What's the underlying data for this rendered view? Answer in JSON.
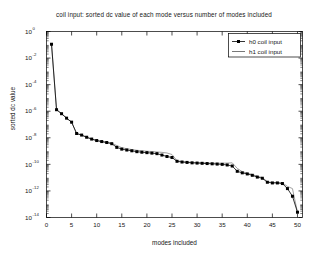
{
  "figure": {
    "background_color": "#ffffff",
    "axes_color": "#000000"
  },
  "chart_data": {
    "type": "line",
    "title": "coil input:  sorted dc value of each mode versus number of modes included",
    "xlabel": "modes included",
    "ylabel": "sorted dc value",
    "yscale": "log",
    "xscale": "linear",
    "xlim": [
      0,
      51
    ],
    "ylim": [
      1e-14,
      1
    ],
    "xticks": [
      0,
      5,
      10,
      15,
      20,
      25,
      30,
      35,
      40,
      45,
      50
    ],
    "xticklabels": [
      "0",
      "5",
      "10",
      "15",
      "20",
      "25",
      "30",
      "35",
      "40",
      "45",
      "50"
    ],
    "yticks": [
      1,
      0.01,
      0.0001,
      1e-06,
      1e-08,
      1e-10,
      1e-12,
      1e-14
    ],
    "yticklabels": [
      "10^0",
      "10^-2",
      "10^-4",
      "10^-6",
      "10^-8",
      "10^-10",
      "10^-12",
      "10^-14"
    ],
    "ytick_mantissa": "10",
    "ytick_exponents": [
      "0",
      "-2",
      "-4",
      "-6",
      "-8",
      "-10",
      "-12",
      "-14"
    ],
    "grid": false,
    "legend_position": "upper right",
    "x": [
      1,
      2,
      3,
      4,
      5,
      6,
      7,
      8,
      9,
      10,
      11,
      12,
      13,
      14,
      15,
      16,
      17,
      18,
      19,
      20,
      21,
      22,
      23,
      24,
      25,
      26,
      27,
      28,
      29,
      30,
      31,
      32,
      33,
      34,
      35,
      36,
      37,
      38,
      39,
      40,
      41,
      42,
      43,
      44,
      45,
      46,
      47,
      48,
      49,
      50
    ],
    "series": [
      {
        "name": "h0 coil input",
        "marker": "filled-square",
        "linestyle": "solid",
        "color": "#000000",
        "values": [
          0.11,
          1.3e-06,
          6.5e-07,
          3e-07,
          1.5e-07,
          2.1e-08,
          1.6e-08,
          1.1e-08,
          8e-09,
          6.2e-09,
          5.2e-09,
          4.4e-09,
          3.6e-09,
          1.9e-09,
          1.4e-09,
          1.2e-09,
          1.05e-09,
          9e-10,
          8.2e-10,
          7.6e-10,
          7e-10,
          6.4e-10,
          5e-10,
          3.9e-10,
          3.3e-10,
          1.7e-10,
          1.5e-10,
          1.4e-10,
          1.3e-10,
          1.25e-10,
          1.2e-10,
          1.15e-10,
          1.1e-10,
          1.05e-10,
          1e-10,
          9e-11,
          7.5e-11,
          3e-11,
          2.3e-11,
          1.9e-11,
          1.5e-11,
          1.1e-11,
          9e-12,
          4.5e-12,
          4e-12,
          4e-12,
          3.6e-12,
          1.5e-12,
          4e-13,
          2.5e-14
        ]
      },
      {
        "name": "h1 coil input",
        "marker": "none",
        "linestyle": "solid",
        "color": "#8c8c8c",
        "values": [
          0.11,
          1.3e-06,
          6.5e-07,
          3e-07,
          1.5e-07,
          2.1e-08,
          1.6e-08,
          1.1e-08,
          8e-09,
          6.2e-09,
          5.2e-09,
          4.5e-09,
          4e-09,
          2.6e-09,
          1.8e-09,
          1.5e-09,
          1.3e-09,
          1.15e-09,
          1.05e-09,
          9.8e-10,
          9.2e-10,
          8.6e-10,
          8e-10,
          7.2e-10,
          5.5e-10,
          1.9e-10,
          1.6e-10,
          1.5e-10,
          1.42e-10,
          1.36e-10,
          1.32e-10,
          1.28e-10,
          1.24e-10,
          1.22e-10,
          1.22e-10,
          1.25e-10,
          1.3e-10,
          5e-11,
          2.8e-11,
          2.2e-11,
          1.7e-11,
          1.3e-11,
          1e-11,
          5e-12,
          4.3e-12,
          4.3e-12,
          4e-12,
          2.2e-12,
          1.5e-12,
          2.5e-14
        ]
      }
    ]
  },
  "legend": {
    "entries": [
      {
        "label": "h0 coil input",
        "marker": "filled-square",
        "color": "#000000"
      },
      {
        "label": "h1 coil input",
        "marker": "none",
        "color": "#555555"
      }
    ]
  }
}
